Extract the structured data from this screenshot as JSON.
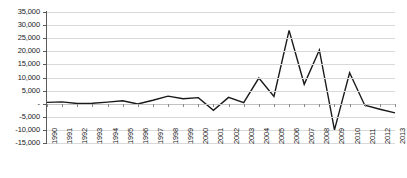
{
  "chart_data": {
    "type": "line",
    "title": "",
    "subtitle": "",
    "xlabel": "",
    "ylabel": "",
    "grid": true,
    "legend": false,
    "legend_position": "none",
    "ylim": [
      -15000,
      35000
    ],
    "ytick_step": 5000,
    "ytick_labels": [
      "35,000",
      "30,000",
      "25,000",
      "20,000",
      "15,000",
      "10,000",
      "5,000",
      "-",
      "-5,000",
      "-10,000",
      "-15,000"
    ],
    "ytick_values": [
      35000,
      30000,
      25000,
      20000,
      15000,
      10000,
      5000,
      0,
      -5000,
      -10000,
      -15000
    ],
    "zero_label": "-",
    "categories": [
      "1990",
      "1991",
      "1992",
      "1993",
      "1994",
      "1995",
      "1996",
      "1997",
      "1998",
      "1999",
      "2000",
      "2001",
      "2002",
      "2003",
      "2004",
      "2005",
      "2006",
      "2007",
      "2008",
      "2009",
      "2010",
      "2011",
      "2012",
      "2013"
    ],
    "series": [
      {
        "name": "",
        "color": "#1a1a1a",
        "values": [
          500,
          700,
          100,
          200,
          600,
          1100,
          -100,
          1300,
          2900,
          1900,
          2300,
          -2500,
          2400,
          400,
          9800,
          2800,
          28000,
          7400,
          20500,
          -10000,
          11800,
          -600,
          -2100,
          -3500
        ]
      }
    ]
  },
  "axes": {
    "y_axis_color": "#5a5a5a",
    "gridline_color": "#d9d9d9",
    "zeroline_color": "#c2c2c2"
  }
}
